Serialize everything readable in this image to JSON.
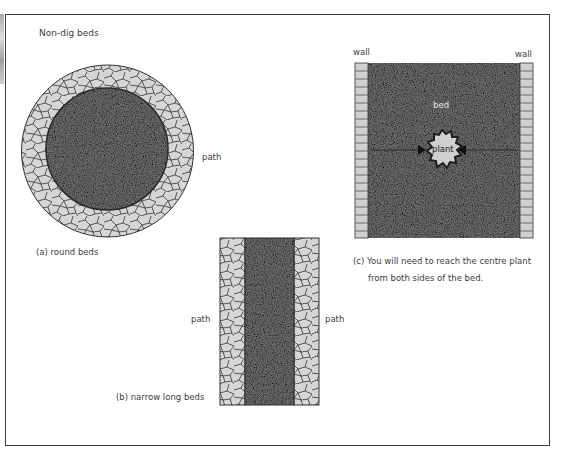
{
  "title": "Non-dig beds",
  "colors": {
    "bed": "#6b6b6b",
    "path_tile": "#d6d6d6",
    "tile_outline": "#333333",
    "wall_brick": "#d0d0d0",
    "plant": "#cfcfcf",
    "frame": "#3a3a3a"
  },
  "panels": {
    "round": {
      "caption": "(a) round beds",
      "path_label": "path"
    },
    "long": {
      "caption": "(b) narrow long beds",
      "path_left_label": "path",
      "path_right_label": "path"
    },
    "walled": {
      "wall_left_label": "wall",
      "wall_right_label": "wall",
      "bed_label": "bed",
      "plant_label": "plant",
      "caption_line1": "(c) You will need to reach the centre plant",
      "caption_line2": "from both sides of the bed."
    }
  }
}
